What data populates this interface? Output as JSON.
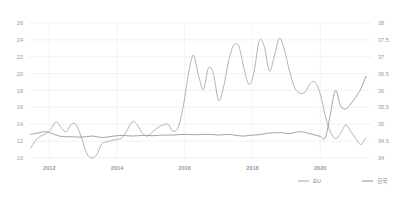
{
  "chart_data": {
    "type": "line",
    "title": "",
    "xlabel": "",
    "ylabel": "",
    "grid": true,
    "legend_position": "bottom-right",
    "x_tick_labels": [
      "2012",
      "2014",
      "2016",
      "2018",
      "2020"
    ],
    "x_tick_values": [
      2012,
      2014,
      2016,
      2018,
      2020
    ],
    "xlim": [
      2011.4,
      2021.5
    ],
    "axes": [
      {
        "id": "left",
        "side": "left",
        "ylim": [
          10,
          26
        ],
        "ticks": [
          10,
          12,
          14,
          16,
          18,
          20,
          22,
          24,
          26
        ],
        "tick_labels": [
          "10",
          "12",
          "14",
          "16",
          "18",
          "20",
          "22",
          "24",
          "26"
        ],
        "series": "EU"
      },
      {
        "id": "right",
        "side": "right",
        "ylim": [
          34,
          38
        ],
        "ticks": [
          34,
          34.5,
          35,
          35.5,
          36,
          36.5,
          37,
          37.5,
          38
        ],
        "tick_labels": [
          "34",
          "34.5",
          "35",
          "35.5",
          "36",
          "36.5",
          "37",
          "37.5",
          "38"
        ],
        "series": "한국"
      }
    ],
    "series": [
      {
        "name": "EU",
        "axis": "left",
        "color": "#a6a6a6",
        "x": [
          2011.45,
          2011.6,
          2011.75,
          2011.9,
          2012.05,
          2012.2,
          2012.35,
          2012.5,
          2012.65,
          2012.8,
          2012.95,
          2013.1,
          2013.25,
          2013.4,
          2013.55,
          2013.7,
          2013.85,
          2014.0,
          2014.15,
          2014.3,
          2014.45,
          2014.6,
          2014.75,
          2014.9,
          2015.05,
          2015.2,
          2015.35,
          2015.5,
          2015.65,
          2015.8,
          2015.95,
          2016.1,
          2016.25,
          2016.4,
          2016.55,
          2016.7,
          2016.85,
          2017.0,
          2017.15,
          2017.3,
          2017.45,
          2017.6,
          2017.75,
          2017.9,
          2018.05,
          2018.2,
          2018.35,
          2018.5,
          2018.65,
          2018.8,
          2018.95,
          2019.1,
          2019.25,
          2019.4,
          2019.55,
          2019.7,
          2019.85,
          2020.0,
          2020.15,
          2020.3,
          2020.45,
          2020.6,
          2020.75,
          2020.9,
          2021.05,
          2021.2,
          2021.35
        ],
        "values": [
          11.2,
          12.1,
          12.6,
          12.9,
          13.4,
          14.3,
          13.6,
          13.1,
          14.0,
          13.9,
          12.4,
          10.6,
          10.0,
          10.4,
          11.7,
          11.9,
          12.1,
          12.2,
          12.4,
          13.3,
          14.3,
          13.9,
          12.9,
          12.6,
          13.1,
          13.6,
          13.9,
          14.0,
          13.2,
          13.6,
          16.0,
          19.7,
          22.2,
          19.9,
          18.1,
          20.7,
          19.9,
          16.8,
          18.5,
          21.6,
          23.4,
          23.2,
          20.6,
          18.7,
          20.3,
          23.9,
          23.2,
          20.3,
          22.2,
          24.2,
          22.7,
          20.2,
          18.3,
          17.7,
          17.8,
          18.8,
          19.0,
          17.6,
          15.0,
          13.1,
          12.3,
          12.9,
          13.9,
          13.2,
          12.3,
          11.6,
          12.4
        ],
        "notes": "Flat ~11-14 until 2014, sharp ramp in 2015, high oscillation 2015-2018, decline through 2019-2020"
      },
      {
        "name": "한국",
        "axis": "right",
        "color": "#8e9396",
        "x": [
          2011.45,
          2011.6,
          2011.75,
          2011.9,
          2012.05,
          2012.2,
          2012.35,
          2012.5,
          2012.65,
          2012.8,
          2012.95,
          2013.1,
          2013.25,
          2013.4,
          2013.55,
          2013.7,
          2013.85,
          2014.0,
          2014.15,
          2014.3,
          2014.45,
          2014.6,
          2014.75,
          2014.9,
          2015.05,
          2015.2,
          2015.35,
          2015.5,
          2015.65,
          2015.8,
          2015.95,
          2016.1,
          2016.25,
          2016.4,
          2016.55,
          2016.7,
          2016.85,
          2017.0,
          2017.15,
          2017.3,
          2017.45,
          2017.6,
          2017.75,
          2017.9,
          2018.05,
          2018.2,
          2018.35,
          2018.5,
          2018.65,
          2018.8,
          2018.95,
          2019.1,
          2019.25,
          2019.4,
          2019.55,
          2019.7,
          2019.85,
          2020.0,
          2020.15,
          2020.3,
          2020.45,
          2020.6,
          2020.75,
          2020.9,
          2021.05,
          2021.2,
          2021.35
        ],
        "values": [
          34.7,
          34.73,
          34.76,
          34.78,
          34.74,
          34.68,
          34.64,
          34.63,
          34.63,
          34.62,
          34.62,
          34.63,
          34.65,
          34.63,
          34.61,
          34.62,
          34.64,
          34.66,
          34.67,
          34.66,
          34.65,
          34.66,
          34.67,
          34.67,
          34.66,
          34.67,
          34.68,
          34.68,
          34.68,
          34.69,
          34.7,
          34.7,
          34.69,
          34.69,
          34.7,
          34.7,
          34.69,
          34.68,
          34.69,
          34.7,
          34.68,
          34.66,
          34.65,
          34.67,
          34.68,
          34.69,
          34.72,
          34.74,
          34.75,
          34.75,
          34.74,
          34.72,
          34.76,
          34.78,
          34.76,
          34.72,
          34.68,
          34.64,
          34.6,
          35.3,
          36.0,
          35.55,
          35.45,
          35.6,
          35.8,
          36.05,
          36.42
        ],
        "notes": "Near-flat around 34.6-34.8 for most of the range, rising sharply from late 2020 to ~36.4"
      }
    ]
  },
  "legend": {
    "items": [
      {
        "label": "EU",
        "color": "#a6a6a6"
      },
      {
        "label": "한국",
        "color": "#8e9396"
      }
    ]
  },
  "colors": {
    "background": "#ffffff",
    "grid": "#eceaea",
    "tick_text": "#9a9a9a",
    "legend_text": "#8d8d8d"
  }
}
